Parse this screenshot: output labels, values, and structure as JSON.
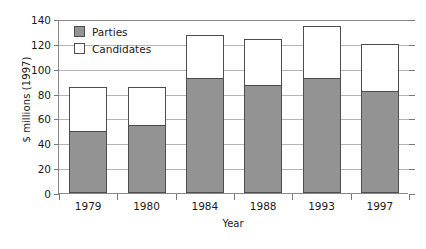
{
  "chart_data": {
    "type": "bar",
    "subtype": "stacked-vertical",
    "title": "",
    "xlabel": "Year",
    "ylabel": "$ millions (1997)",
    "categories": [
      "1979",
      "1980",
      "1984",
      "1988",
      "1993",
      "1997"
    ],
    "series": [
      {
        "name": "Parties",
        "color": "#939393",
        "values": [
          50,
          55,
          93,
          87,
          93,
          82
        ]
      },
      {
        "name": "Candidates",
        "color": "#ffffff",
        "values": [
          35,
          30,
          34,
          37,
          41,
          38
        ]
      }
    ],
    "totals": [
      85,
      85,
      127,
      124,
      134,
      120
    ],
    "ylim": [
      0,
      140
    ],
    "ytick_step": 20,
    "yticks": [
      "0",
      "20",
      "40",
      "60",
      "80",
      "100",
      "120",
      "140"
    ],
    "grid": "horizontal",
    "legend_position": "top-left-inside",
    "legend": [
      "Parties",
      "Candidates"
    ]
  },
  "axis": {
    "y_title": "$ millions (1997)",
    "x_title": "Year"
  }
}
